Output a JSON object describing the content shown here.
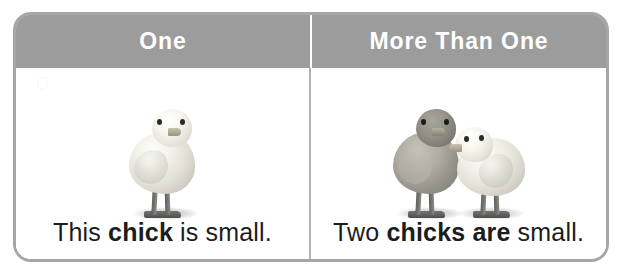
{
  "worksheet": {
    "name": "singular-plural-comparison-table",
    "columns": [
      {
        "id": "one",
        "header": "One",
        "image": {
          "subject": "chick-photo",
          "count": 1,
          "description": "one pale yellow baby chick standing"
        },
        "caption": {
          "full_text": "This chick is small.",
          "words": [
            {
              "text": "This",
              "bold": false
            },
            {
              "text": "chick",
              "bold": true
            },
            {
              "text": "is",
              "bold": false
            },
            {
              "text": "small.",
              "bold": false
            }
          ]
        }
      },
      {
        "id": "more-than-one",
        "header": "More Than One",
        "image": {
          "subject": "chicks-photo",
          "count": 2,
          "description": "two baby chicks, one darker gray and one pale, facing each other"
        },
        "caption": {
          "full_text": "Two chicks are small.",
          "words": [
            {
              "text": "Two",
              "bold": false
            },
            {
              "text": "chicks",
              "bold": true
            },
            {
              "text": "are",
              "bold": true
            },
            {
              "text": "small.",
              "bold": false
            }
          ]
        }
      }
    ]
  },
  "colors": {
    "header_background": "#9c9c9c",
    "header_text": "#ffffff",
    "frame_border": "#a6a6a6",
    "divider": "#b2b2b2",
    "cell_background": "#ffffff",
    "caption_text": "#1c1c1c"
  }
}
